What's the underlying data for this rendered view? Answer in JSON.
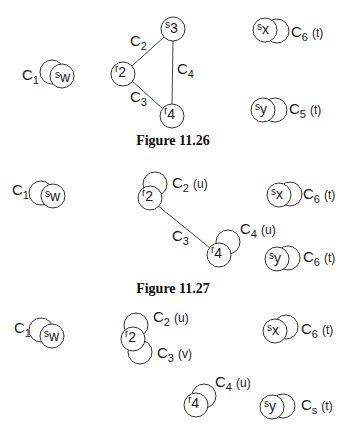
{
  "figures": [
    {
      "caption": "Figure 11.26",
      "nodes": {
        "sw": {
          "main": "s",
          "sub": "w"
        },
        "s3": {
          "main": "s",
          "sub": "3"
        },
        "r2": {
          "main": "r",
          "sub": "2"
        },
        "r4": {
          "main": "r",
          "sub": "4"
        },
        "sx": {
          "main": "s",
          "sub": "x"
        },
        "sy": {
          "main": "s",
          "sub": "y"
        }
      },
      "labels": {
        "c1": {
          "main": "C",
          "sub": "1",
          "tag": ""
        },
        "c2": {
          "main": "C",
          "sub": "2",
          "tag": ""
        },
        "c3": {
          "main": "C",
          "sub": "3",
          "tag": ""
        },
        "c4": {
          "main": "C",
          "sub": "4",
          "tag": ""
        },
        "c6": {
          "main": "C",
          "sub": "6",
          "tag": "(t)"
        },
        "c5": {
          "main": "C",
          "sub": "5",
          "tag": "(t)"
        }
      },
      "edges": [
        [
          "r2",
          "s3",
          "C2"
        ],
        [
          "r2",
          "r4",
          "C3"
        ],
        [
          "s3",
          "r4",
          "C4"
        ]
      ]
    },
    {
      "caption": "Figure 11.27",
      "nodes": {
        "sw": {
          "main": "s",
          "sub": "w"
        },
        "r2": {
          "main": "r",
          "sub": "2"
        },
        "r4": {
          "main": "r",
          "sub": "4"
        },
        "sx": {
          "main": "s",
          "sub": "x"
        },
        "sy": {
          "main": "s",
          "sub": "y"
        }
      },
      "labels": {
        "c1": {
          "main": "C",
          "sub": "1",
          "tag": ""
        },
        "c2": {
          "main": "C",
          "sub": "2",
          "tag": "(u)"
        },
        "c3": {
          "main": "C",
          "sub": "3",
          "tag": ""
        },
        "c4": {
          "main": "C",
          "sub": "4",
          "tag": "(u)"
        },
        "c6a": {
          "main": "C",
          "sub": "6",
          "tag": "(t)"
        },
        "c6b": {
          "main": "C",
          "sub": "6",
          "tag": "(t)"
        }
      },
      "edges": [
        [
          "r2",
          "r4",
          "C3"
        ]
      ]
    },
    {
      "caption": "",
      "nodes": {
        "sw": {
          "main": "s",
          "sub": "w"
        },
        "r2": {
          "main": "r",
          "sub": "2"
        },
        "r4": {
          "main": "r",
          "sub": "4"
        },
        "sx": {
          "main": "s",
          "sub": "x"
        },
        "sy": {
          "main": "s",
          "sub": "y"
        }
      },
      "labels": {
        "c1": {
          "main": "C",
          "sub": "1",
          "tag": ""
        },
        "c2": {
          "main": "C",
          "sub": "2",
          "tag": "(u)"
        },
        "c3": {
          "main": "C",
          "sub": "3",
          "tag": "(v)"
        },
        "c4": {
          "main": "C",
          "sub": "4",
          "tag": "(u)"
        },
        "c6": {
          "main": "C",
          "sub": "6",
          "tag": "(t)"
        },
        "cs": {
          "main": "C",
          "sub": "s",
          "tag": "(t)"
        }
      },
      "edges": []
    }
  ]
}
